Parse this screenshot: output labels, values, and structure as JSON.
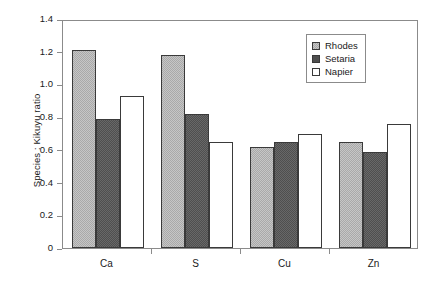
{
  "chart_data": {
    "type": "bar",
    "title": "",
    "subtitle": "",
    "xlabel": "",
    "ylabel": "Species : Kikuyu ratio",
    "categories": [
      "Ca",
      "S",
      "Cu",
      "Zn"
    ],
    "ylim": [
      0,
      1.4
    ],
    "yticks": [
      0,
      0.2,
      0.4,
      0.6,
      0.8,
      1.0,
      1.2,
      1.4
    ],
    "ytick_labels": [
      "0",
      "0.2",
      "0.4",
      "0.6",
      "0.8",
      "1.0",
      "1.2",
      "1.4"
    ],
    "grid": false,
    "legend_position": "top-right",
    "series": [
      {
        "name": "Rhodes",
        "color": "#a9a9a9",
        "values": [
          1.21,
          1.18,
          0.62,
          0.65
        ]
      },
      {
        "name": "Setaria",
        "color": "#4f4f4f",
        "values": [
          0.79,
          0.82,
          0.65,
          0.59
        ]
      },
      {
        "name": "Napier",
        "color": "#ffffff",
        "values": [
          0.93,
          0.65,
          0.7,
          0.76
        ]
      }
    ],
    "annotations": []
  },
  "legend": {
    "items": [
      {
        "label": "Rhodes",
        "swatch": "rhodes"
      },
      {
        "label": "Setaria",
        "swatch": "setaria"
      },
      {
        "label": "Napier",
        "swatch": "napier"
      }
    ]
  },
  "axes": {
    "frame_color": "#8b8b8b",
    "text_color": "#1a1a1a"
  }
}
